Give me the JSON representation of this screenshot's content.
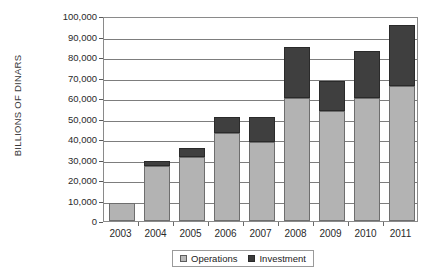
{
  "chart_data": {
    "type": "bar",
    "stacked": true,
    "title": "",
    "xlabel": "",
    "ylabel": "BILLIONS OF DINARS",
    "categories": [
      "2003",
      "2004",
      "2005",
      "2006",
      "2007",
      "2008",
      "2009",
      "2010",
      "2011"
    ],
    "series": [
      {
        "name": "Operations",
        "color": "#b3b3b3",
        "values": [
          8800,
          27000,
          31000,
          43000,
          38500,
          60000,
          53500,
          60000,
          66000
        ]
      },
      {
        "name": "Investment",
        "color": "#3f3f3f",
        "values": [
          0,
          2500,
          4500,
          7500,
          12000,
          25000,
          15000,
          23000,
          29500
        ]
      }
    ],
    "totals": [
      8800,
      29500,
      35500,
      50500,
      50500,
      85000,
      68500,
      83000,
      95500
    ],
    "ylim": [
      0,
      100000
    ],
    "yticks": [
      0,
      10000,
      20000,
      30000,
      40000,
      50000,
      60000,
      70000,
      80000,
      90000,
      100000
    ],
    "ytick_labels": [
      "0",
      "10,000",
      "20,000",
      "30,000",
      "40,000",
      "50,000",
      "60,000",
      "70,000",
      "80,000",
      "90,000",
      "100,000"
    ],
    "grid": true,
    "legend_position": "bottom"
  },
  "legend": {
    "items": [
      {
        "label": "Operations",
        "marker": "square-light-icon"
      },
      {
        "label": "Investment",
        "marker": "square-dark-icon"
      }
    ]
  }
}
